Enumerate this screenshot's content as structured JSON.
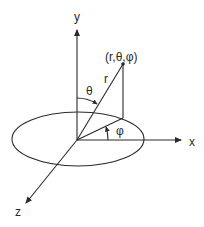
{
  "diagram": {
    "axes": {
      "x_label": "x",
      "y_label": "y",
      "z_label": "z"
    },
    "point_label": "(r,θ,φ)",
    "radius_label": "r",
    "polar_angle_label": "θ",
    "azimuth_angle_label": "φ",
    "colors": {
      "stroke": "#2a2a2a",
      "background": "#ffffff"
    }
  }
}
